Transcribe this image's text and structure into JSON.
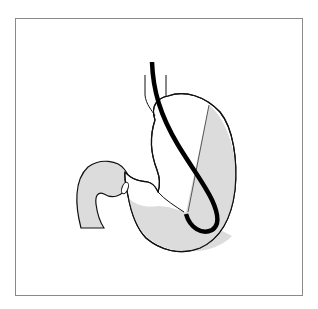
{
  "figure": {
    "colors": {
      "background": "#ffffff",
      "frame": "#8a8a8a",
      "outline": "#111111",
      "shaded_region": "#dcdcdc",
      "endoscope": "#000000"
    },
    "parts": [
      {
        "id": "frame",
        "label": "Figure frame"
      },
      {
        "id": "esophagus",
        "label": "Esophagus"
      },
      {
        "id": "stomach-body",
        "label": "Stomach"
      },
      {
        "id": "shaded-region",
        "label": "Shaded (visualized) region"
      },
      {
        "id": "pylorus",
        "label": "Pylorus"
      },
      {
        "id": "duodenum",
        "label": "Duodenum"
      },
      {
        "id": "endoscope",
        "label": "Retroflexed endoscope"
      }
    ]
  }
}
